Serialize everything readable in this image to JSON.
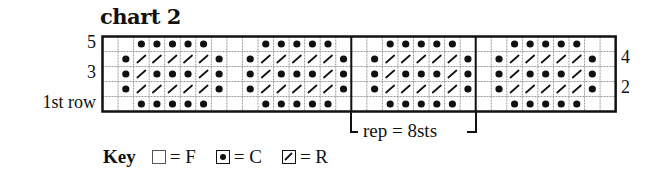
{
  "title": "chart 2",
  "row_labels_left": [
    {
      "text": "5",
      "row": 0
    },
    {
      "text": "3",
      "row": 2
    },
    {
      "text": "1st row",
      "row": 4
    }
  ],
  "row_labels_right": [
    {
      "text": "4",
      "row": 1
    },
    {
      "text": "2",
      "row": 3
    }
  ],
  "grid": {
    "columns": 33,
    "rows": 5,
    "cell_w": 15.55,
    "cell_h": 15,
    "repeat_width": 8,
    "thick_lines_at_columns": [
      16,
      24
    ],
    "repeat_unit_rows_top_to_bottom": [
      "FFCCCCCF",
      "FCRRRRRC",
      "FCRCCCRC",
      "FCRRRRRC",
      "FFCCCCCF"
    ],
    "trailing_column": "F"
  },
  "repeat": {
    "label": "rep = 8sts",
    "start_col": 16,
    "end_col": 24
  },
  "key": {
    "label": "Key",
    "items": [
      {
        "symbol": "empty-square",
        "text": "= F"
      },
      {
        "symbol": "dot-square",
        "text": "= C"
      },
      {
        "symbol": "slash-square",
        "text": "= R"
      }
    ]
  },
  "colors": {
    "ink": "#111111",
    "gridline": "#9a9a9a",
    "background": "#ffffff"
  }
}
